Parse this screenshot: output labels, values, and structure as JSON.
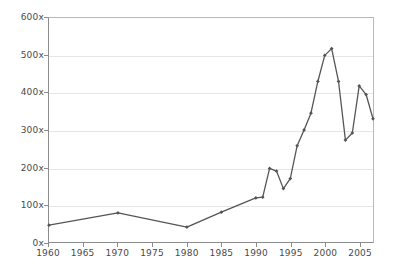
{
  "chart_data": {
    "type": "line",
    "title": "",
    "subtitle": "",
    "xlabel": "",
    "ylabel": "",
    "xlim": [
      1960,
      2007
    ],
    "ylim": [
      0,
      600
    ],
    "grid": true,
    "legend": null,
    "legend_position": "none",
    "y_ticks": [
      {
        "value": 600,
        "label": "600x"
      },
      {
        "value": 500,
        "label": "500x"
      },
      {
        "value": 400,
        "label": "400x"
      },
      {
        "value": 300,
        "label": "300x"
      },
      {
        "value": 200,
        "label": "200x"
      },
      {
        "value": 100,
        "label": "100x"
      },
      {
        "value": 0,
        "label": "0x"
      }
    ],
    "x_ticks": [
      {
        "value": 1960,
        "label": "1960"
      },
      {
        "value": 1965,
        "label": "1965"
      },
      {
        "value": 1970,
        "label": "1970"
      },
      {
        "value": 1975,
        "label": "1975"
      },
      {
        "value": 1980,
        "label": "1980"
      },
      {
        "value": 1985,
        "label": "1985"
      },
      {
        "value": 1990,
        "label": "1990"
      },
      {
        "value": 1995,
        "label": "1995"
      },
      {
        "value": 2000,
        "label": "2000"
      },
      {
        "value": 2005,
        "label": "2005"
      }
    ],
    "series": [
      {
        "name": "",
        "color": "#555555",
        "marker": "diamond",
        "x": [
          1960,
          1970,
          1980,
          1985,
          1990,
          1991,
          1992,
          1993,
          1994,
          1995,
          1996,
          1997,
          1998,
          1999,
          2000,
          2001,
          2002,
          2003,
          2004,
          2005,
          2006,
          2007
        ],
        "values": [
          45,
          78,
          40,
          80,
          118,
          120,
          197,
          190,
          143,
          170,
          258,
          300,
          345,
          430,
          500,
          518,
          430,
          273,
          292,
          418,
          395,
          330
        ]
      }
    ]
  },
  "axis_colors": {
    "axis_line": "#8c8c8c",
    "grid_line": "#e6e6e6",
    "tick_text": "#4a4a4a",
    "series_line": "#555555",
    "background": "#ffffff"
  }
}
